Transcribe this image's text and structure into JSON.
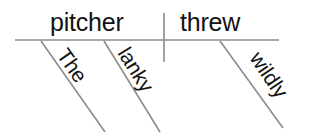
{
  "diagram": {
    "type": "sentence-diagram",
    "sentence": "The lanky pitcher threw wildly.",
    "colors": {
      "line": "#8c8c8c",
      "text": "#121212",
      "background": "#ffffff"
    },
    "baseline": {
      "name": "main-baseline",
      "x1": 15,
      "y1": 40,
      "x2": 279,
      "y2": 40
    },
    "divider": {
      "name": "subject-predicate-divider",
      "x": 164,
      "y1": 13,
      "y2": 62
    },
    "main_words": [
      {
        "label": "pitcher",
        "role": "subject",
        "x": 50,
        "y": 31
      },
      {
        "label": "threw",
        "role": "verb",
        "x": 180,
        "y": 31
      }
    ],
    "modifiers": [
      {
        "label": "The",
        "role": "article-modifier-of-subject",
        "line": {
          "x1": 41,
          "y1": 41,
          "x2": 105,
          "y2": 132
        },
        "text_x": 56,
        "text_y": 55,
        "rotation": 55
      },
      {
        "label": "lanky",
        "role": "adjective-modifier-of-subject",
        "line": {
          "x1": 104,
          "y1": 41,
          "x2": 160,
          "y2": 132
        },
        "text_x": 117,
        "text_y": 53,
        "rotation": 58
      },
      {
        "label": "wildly",
        "role": "adverb-modifier-of-verb",
        "line": {
          "x1": 220,
          "y1": 41,
          "x2": 283,
          "y2": 128
        },
        "text_x": 249,
        "text_y": 58,
        "rotation": 56
      }
    ]
  }
}
